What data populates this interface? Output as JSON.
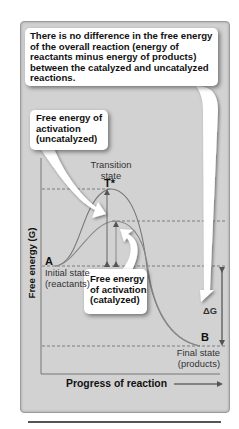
{
  "callouts": {
    "top": "There is no difference in the free energy of the overall reaction (energy of reactants minus energy of products) between the catalyzed and uncatalyzed reactions.",
    "uncatalyzed": "Free energy of activation (uncatalyzed)",
    "catalyzed": "Free energy of activation (catalyzed)"
  },
  "labels": {
    "transition_state_line1": "Transition",
    "transition_state_line2": "state",
    "transition_symbol": "T*",
    "point_a": "A",
    "initial_state_line1": "Initial state",
    "initial_state_line2": "(reactants)",
    "delta_g": "ΔG",
    "point_b": "B",
    "final_state_line1": "Final state",
    "final_state_line2": "(products)"
  },
  "axes": {
    "y_label": "Free energy (G)",
    "x_label": "Progress of reaction"
  },
  "colors": {
    "panel_bg": "#d2d2d2",
    "curve": "#777777",
    "dashed": "#666666",
    "text": "#111111"
  },
  "levels": {
    "uncatalyzed_peak_y": 189,
    "catalyzed_peak_y": 221,
    "reactants_y": 266,
    "products_y": 346
  }
}
